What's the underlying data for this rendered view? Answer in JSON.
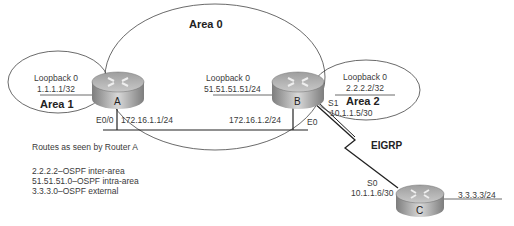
{
  "areas": {
    "area0": "Area 0",
    "area1": "Area 1",
    "area2": "Area 2"
  },
  "routers": {
    "A": {
      "label": "A",
      "loopback_name": "Loopback 0",
      "loopback_ip": "1.1.1.1/32",
      "interface": "E0/0",
      "interface_ip": "172.16.1.1/24"
    },
    "B": {
      "label": "B",
      "loopback_name": "Loopback 0",
      "loopback_ip": "51.51.51.51/24",
      "loopback2_name": "Loopback 0",
      "loopback2_ip": "2.2.2.2/32",
      "ethernet_ip": "172.16.1.2/24",
      "ethernet_if": "E0",
      "serial_if": "S1",
      "serial_ip": "10.1.1.5/30"
    },
    "C": {
      "label": "C",
      "serial_if": "S0",
      "serial_ip": "10.1.1.6/30",
      "lan_ip": "3.3.3.3/24"
    }
  },
  "link": {
    "protocol": "EIGRP"
  },
  "routes": {
    "title": "Routes as seen by Router A",
    "entries": [
      "2.2.2.2–OSPF inter-area",
      "51.51.51.0–OSPF intra-area",
      "3.3.3.0–OSPF external"
    ]
  },
  "colors": {
    "line": "#2b2b2b",
    "router_top": "#b9b9b9",
    "router_side": "#8a8a8a"
  }
}
